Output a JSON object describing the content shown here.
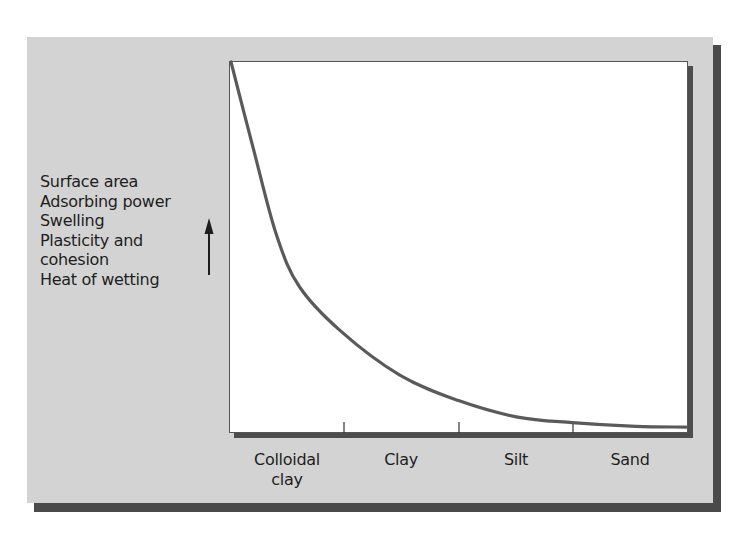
{
  "chart_data": {
    "type": "line",
    "title": "",
    "xlabel": "",
    "ylabel": "Surface area / Adsorbing power / Swelling / Plasticity and cohesion / Heat of wetting",
    "categories": [
      "Colloidal clay",
      "Clay",
      "Silt",
      "Sand"
    ],
    "series": [
      {
        "name": "Surface area, adsorbing power, swelling, plasticity and cohesion, heat of wetting",
        "x": [
          0.0,
          0.05,
          0.1,
          0.15,
          0.24,
          0.37,
          0.5,
          0.63,
          0.75,
          0.89,
          1.0
        ],
        "values": [
          100,
          76,
          53,
          39,
          27,
          15,
          8,
          3.5,
          2,
          1,
          0.8
        ]
      }
    ],
    "ylim": [
      0,
      100
    ],
    "xlim": [
      0,
      1
    ],
    "grid": false,
    "legend": "none",
    "arrow": "up",
    "annotation": "Properties increase upward as particle size decreases"
  },
  "y_axis": {
    "labels": [
      "Surface area",
      "Adsorbing power",
      "Swelling",
      "Plasticity and",
      "cohesion",
      "Heat of wetting"
    ]
  },
  "x_axis": {
    "labels": [
      {
        "text": "Colloidal\nclay",
        "center": 287
      },
      {
        "text": "Clay",
        "center": 401
      },
      {
        "text": "Silt",
        "center": 516
      },
      {
        "text": "Sand",
        "center": 630
      }
    ],
    "ticks": [
      344,
      459,
      573
    ]
  },
  "colors": {
    "panel": "#d3d3d3",
    "shadow": "#4a4a4a",
    "curve": "#5a5a5a",
    "plot_bg": "#ffffff",
    "text": "#1e1e1e"
  }
}
